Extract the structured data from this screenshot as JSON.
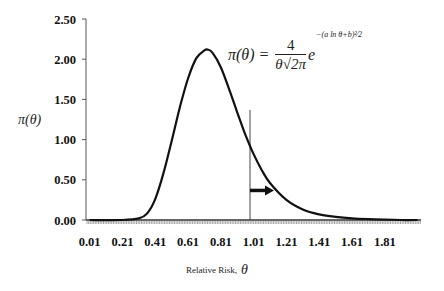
{
  "chart_data": {
    "type": "line",
    "title": "",
    "xlabel": "Relative Risk, θ",
    "ylabel": "π(θ)",
    "xlim": [
      0.01,
      2.0
    ],
    "ylim": [
      0,
      2.5
    ],
    "x_tick_labels": [
      "0.01",
      "0.21",
      "0.41",
      "0.61",
      "0.81",
      "1.01",
      "1.21",
      "1.41",
      "1.61",
      "1.81"
    ],
    "y_tick_labels": [
      "0.00",
      "0.50",
      "1.00",
      "1.50",
      "2.00",
      "2.50"
    ],
    "grid": false,
    "legend": null,
    "annotations": [
      {
        "type": "formula",
        "text": "π(θ) = 4 / (θ√(2π)) · e^(−(a ln θ + b)² / 2)"
      },
      {
        "type": "vertical_line",
        "x": 1.0,
        "y_top": 1.0
      },
      {
        "type": "arrow",
        "direction": "right",
        "x_start": 1.0,
        "y": 0.38
      }
    ],
    "series": [
      {
        "name": "π(θ)",
        "x": [
          0.01,
          0.21,
          0.31,
          0.36,
          0.41,
          0.46,
          0.51,
          0.56,
          0.61,
          0.66,
          0.71,
          0.73,
          0.76,
          0.81,
          0.86,
          0.91,
          0.96,
          1.01,
          1.06,
          1.11,
          1.21,
          1.31,
          1.41,
          1.51,
          1.61,
          1.71,
          1.81,
          1.91,
          2.01
        ],
        "values": [
          0.0,
          0.0,
          0.02,
          0.08,
          0.26,
          0.58,
          0.98,
          1.4,
          1.76,
          2.01,
          2.11,
          2.12,
          2.08,
          1.9,
          1.63,
          1.34,
          1.06,
          0.82,
          0.62,
          0.46,
          0.25,
          0.13,
          0.07,
          0.04,
          0.02,
          0.01,
          0.005,
          0.0,
          0.0
        ]
      }
    ]
  },
  "labels": {
    "ylabel": "π(θ)",
    "xlabel": "Relative Risk, θ",
    "formula_lhs": "π(θ) =",
    "formula_num": "4",
    "formula_den": "θ√2π",
    "formula_e": "e",
    "formula_exp": "−(a ln θ+b)²⁄2"
  }
}
